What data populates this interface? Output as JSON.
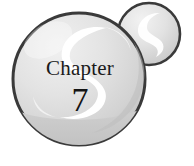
{
  "graphic": {
    "name": "chapter-heading-sphere-graphic",
    "chapter_word": "Chapter",
    "chapter_number": "7",
    "colors": {
      "background": "#ffffff",
      "sphere_outline": "#3a3a3a",
      "sphere_light": "#ededed",
      "sphere_mid": "#d8d8d8",
      "sphere_shade": "#c4c4c4",
      "sphere_bottom_band": "#cfcfcf",
      "highlight": "#ffffff",
      "text": "#1a1a1a"
    },
    "shapes": [
      {
        "name": "small-sphere",
        "type": "circle",
        "cx": 149,
        "cy": 34,
        "r": 31
      },
      {
        "name": "large-sphere",
        "type": "circle",
        "cx": 79,
        "cy": 79,
        "r": 66
      },
      {
        "name": "small-sphere-highlight",
        "type": "comma-gloss"
      },
      {
        "name": "large-sphere-highlight",
        "type": "comma-gloss"
      },
      {
        "name": "large-sphere-bottom-reflection",
        "type": "arc-band"
      }
    ]
  }
}
